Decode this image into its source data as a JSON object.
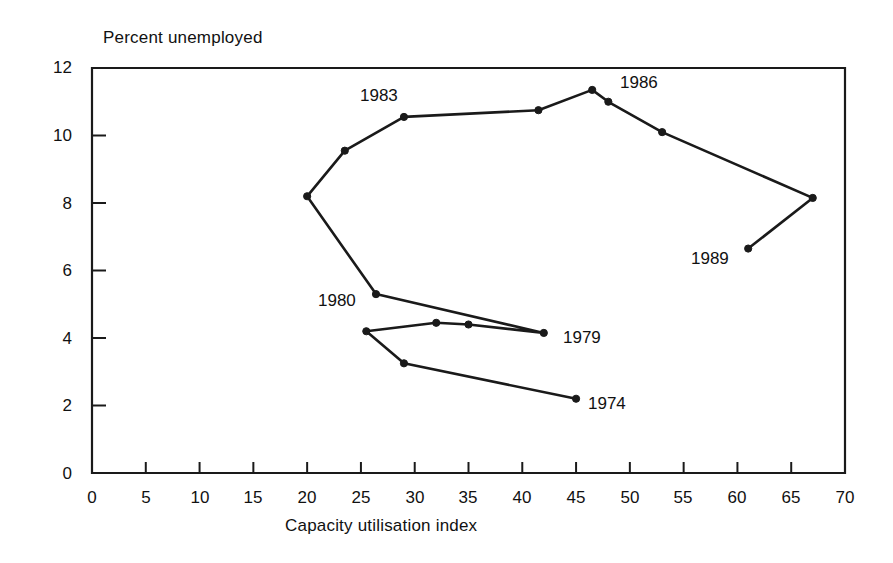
{
  "figure": {
    "ylabel": "Percent unemployed",
    "xlabel": "Capacity utilisation index"
  },
  "chart_data": {
    "type": "line",
    "title": "",
    "subtitle": "",
    "xlabel": "Capacity utilisation index",
    "ylabel": "Percent unemployed",
    "xlim": [
      0,
      70
    ],
    "ylim": [
      0,
      12
    ],
    "xticks": [
      0,
      5,
      10,
      15,
      20,
      25,
      30,
      35,
      40,
      45,
      50,
      55,
      60,
      65,
      70
    ],
    "yticks": [
      0,
      2,
      4,
      6,
      8,
      10,
      12
    ],
    "xtick_labels": [
      "0",
      "5",
      "10",
      "15",
      "20",
      "25",
      "30",
      "35",
      "40",
      "45",
      "50",
      "55",
      "60",
      "65",
      "70"
    ],
    "ytick_labels": [
      "0",
      "2",
      "4",
      "6",
      "8",
      "10",
      "12"
    ],
    "grid": false,
    "legend": "none",
    "marker": "filled-circle",
    "line_color": "#1a1a1a",
    "series": [
      {
        "name": "Capacity utilisation vs unemployment path",
        "points": [
          {
            "year": "1974",
            "x": 45.0,
            "y": 2.2
          },
          {
            "year": "1975",
            "x": 29.0,
            "y": 3.25
          },
          {
            "year": "1976",
            "x": 25.5,
            "y": 4.2
          },
          {
            "year": "1977",
            "x": 32.0,
            "y": 4.45
          },
          {
            "year": "1978",
            "x": 35.0,
            "y": 4.4
          },
          {
            "year": "1979",
            "x": 42.0,
            "y": 4.15
          },
          {
            "year": "1980",
            "x": 26.4,
            "y": 5.3
          },
          {
            "year": "1981",
            "x": 20.0,
            "y": 8.2
          },
          {
            "year": "1982",
            "x": 23.5,
            "y": 9.55
          },
          {
            "year": "1983",
            "x": 29.0,
            "y": 10.55
          },
          {
            "year": "1984",
            "x": 41.5,
            "y": 10.75
          },
          {
            "year": "1985",
            "x": 46.5,
            "y": 11.35
          },
          {
            "year": "1986",
            "x": 48.0,
            "y": 11.0
          },
          {
            "year": "1987",
            "x": 53.0,
            "y": 10.1
          },
          {
            "year": "1988",
            "x": 67.0,
            "y": 8.15
          },
          {
            "year": "1989",
            "x": 61.0,
            "y": 6.65
          }
        ]
      }
    ],
    "annotations": [
      {
        "text": "1974",
        "x": 45.0,
        "y": 2.2,
        "anchor": "right"
      },
      {
        "text": "1979",
        "x": 42.0,
        "y": 4.15,
        "anchor": "right"
      },
      {
        "text": "1980",
        "x": 26.4,
        "y": 5.3,
        "anchor": "left"
      },
      {
        "text": "1983",
        "x": 29.0,
        "y": 10.55,
        "anchor": "above-left"
      },
      {
        "text": "1986",
        "x": 48.0,
        "y": 11.0,
        "anchor": "right"
      },
      {
        "text": "1989",
        "x": 61.0,
        "y": 6.65,
        "anchor": "left"
      }
    ]
  },
  "annotation_labels": {
    "a1974": "1974",
    "a1979": "1979",
    "a1980": "1980",
    "a1983": "1983",
    "a1986": "1986",
    "a1989": "1989"
  },
  "xtick_text": {
    "t0": "0",
    "t1": "5",
    "t2": "10",
    "t3": "15",
    "t4": "20",
    "t5": "25",
    "t6": "30",
    "t7": "35",
    "t8": "40",
    "t9": "45",
    "t10": "50",
    "t11": "55",
    "t12": "60",
    "t13": "65",
    "t14": "70"
  },
  "ytick_text": {
    "t0": "0",
    "t1": "2",
    "t2": "4",
    "t3": "6",
    "t4": "8",
    "t5": "10",
    "t6": "12"
  }
}
